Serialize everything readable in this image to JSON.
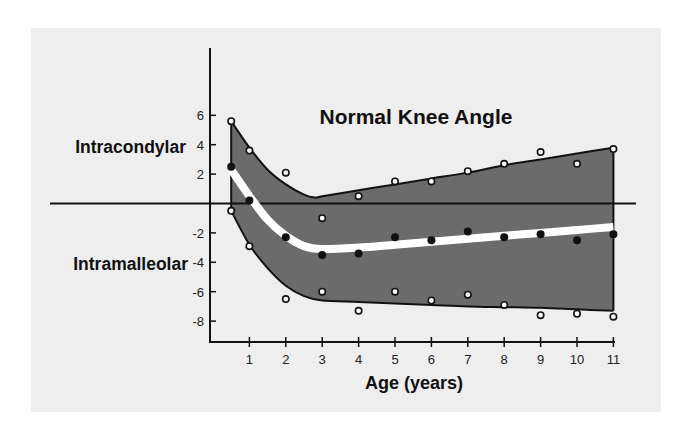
{
  "chart_data": {
    "type": "line",
    "title": "Normal Knee Angle",
    "xlabel": "Age (years)",
    "ylabel": "",
    "side_labels": {
      "positive": "Intracondylar",
      "negative": "Intramalleolar"
    },
    "x_ticks": [
      1,
      2,
      3,
      4,
      5,
      6,
      7,
      8,
      9,
      10,
      11
    ],
    "y_ticks": [
      6,
      4,
      2,
      -2,
      -4,
      -6,
      -8
    ],
    "xlim": [
      0,
      11
    ],
    "ylim": [
      -9,
      9
    ],
    "grid": false,
    "legend": null,
    "series": [
      {
        "name": "Mean (filled dots)",
        "marker": "filled",
        "points": [
          [
            0.5,
            2.5
          ],
          [
            1,
            0.2
          ],
          [
            2,
            -2.3
          ],
          [
            3,
            -3.5
          ],
          [
            4,
            -3.4
          ],
          [
            5,
            -2.3
          ],
          [
            6,
            -2.5
          ],
          [
            7,
            -1.9
          ],
          [
            8,
            -2.3
          ],
          [
            9,
            -2.1
          ],
          [
            10,
            -2.5
          ],
          [
            11,
            -2.1
          ]
        ]
      },
      {
        "name": "Upper range (open dots)",
        "marker": "open",
        "points": [
          [
            0.5,
            5.6
          ],
          [
            1,
            3.6
          ],
          [
            2,
            2.1
          ],
          [
            3,
            -1.0
          ],
          [
            4,
            0.5
          ],
          [
            5,
            1.5
          ],
          [
            6,
            1.5
          ],
          [
            7,
            2.2
          ],
          [
            8,
            2.7
          ],
          [
            9,
            3.5
          ],
          [
            10,
            2.7
          ],
          [
            11,
            3.7
          ]
        ]
      },
      {
        "name": "Lower range (open dots)",
        "marker": "open",
        "points": [
          [
            0.5,
            -0.5
          ],
          [
            1,
            -2.9
          ],
          [
            2,
            -6.5
          ],
          [
            3,
            -6.0
          ],
          [
            4,
            -7.3
          ],
          [
            5,
            -6.0
          ],
          [
            6,
            -6.6
          ],
          [
            7,
            -6.2
          ],
          [
            8,
            -6.9
          ],
          [
            9,
            -7.6
          ],
          [
            10,
            -7.5
          ],
          [
            11,
            -7.7
          ]
        ]
      }
    ],
    "band": {
      "upper": [
        [
          0.5,
          5.6
        ],
        [
          1,
          3.8
        ],
        [
          1.5,
          2.3
        ],
        [
          2,
          1.3
        ],
        [
          2.5,
          0.6
        ],
        [
          2.8,
          0.4
        ],
        [
          3,
          0.5
        ],
        [
          4,
          0.9
        ],
        [
          5,
          1.3
        ],
        [
          6,
          1.7
        ],
        [
          7,
          2.1
        ],
        [
          8,
          2.6
        ],
        [
          9,
          3.0
        ],
        [
          10,
          3.4
        ],
        [
          11,
          3.8
        ]
      ],
      "lower": [
        [
          0.5,
          -0.5
        ],
        [
          1,
          -2.8
        ],
        [
          1.5,
          -4.4
        ],
        [
          2,
          -5.6
        ],
        [
          2.5,
          -6.3
        ],
        [
          3,
          -6.6
        ],
        [
          4,
          -6.7
        ],
        [
          5,
          -6.8
        ],
        [
          6,
          -6.9
        ],
        [
          7,
          -7.0
        ],
        [
          8,
          -7.05
        ],
        [
          9,
          -7.1
        ],
        [
          10,
          -7.2
        ],
        [
          11,
          -7.3
        ]
      ],
      "color": "#6b6b6b"
    },
    "mean_curve": {
      "points": [
        [
          0.5,
          2.3
        ],
        [
          1,
          0.5
        ],
        [
          1.5,
          -1.1
        ],
        [
          2,
          -2.2
        ],
        [
          2.5,
          -2.9
        ],
        [
          3,
          -3.1
        ],
        [
          4,
          -3.0
        ],
        [
          5,
          -2.8
        ],
        [
          6,
          -2.6
        ],
        [
          7,
          -2.4
        ],
        [
          8,
          -2.2
        ],
        [
          9,
          -2.0
        ],
        [
          10,
          -1.8
        ],
        [
          11,
          -1.6
        ]
      ],
      "color": "#ffffff"
    }
  },
  "colors": {
    "panel": "#eeeeee",
    "band": "#6b6b6b",
    "line": "#111111",
    "mean": "#ffffff"
  }
}
